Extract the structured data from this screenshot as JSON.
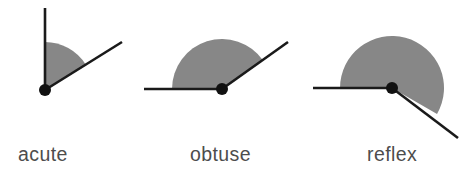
{
  "figure": {
    "background_color": "#ffffff",
    "width": 467,
    "height": 173,
    "sector_fill_color": "#878787",
    "ray_color": "#1a1a1a",
    "vertex_dot_color": "#111111",
    "label_color": "#4d4d4d"
  },
  "chart_data": {
    "type": "diagram",
    "subtitle": "",
    "diagram_kind": "angle-classification",
    "legend_position": "below-each-figure",
    "grid": false,
    "items": [
      {
        "label": "acute",
        "angle_degrees": 58,
        "classification": "acute",
        "vertex": {
          "x": 45,
          "y": 90
        },
        "sector_radius": 48,
        "dot_radius": 6,
        "shaded_from_degrees": 90,
        "shaded_to_degrees": 32,
        "rays": [
          {
            "name": "vertical-ray",
            "angle_degrees": 90,
            "length": 82,
            "end": {
              "x": 45,
              "y": 8
            }
          },
          {
            "name": "diagonal-ray",
            "angle_degrees": 32,
            "length": 91,
            "end": {
              "x": 122,
              "y": 42
            }
          }
        ]
      },
      {
        "label": "obtuse",
        "angle_degrees": 145,
        "classification": "obtuse",
        "vertex": {
          "x": 222,
          "y": 89
        },
        "sector_radius": 50,
        "dot_radius": 6,
        "shaded_from_degrees": 180,
        "shaded_to_degrees": 35,
        "rays": [
          {
            "name": "horizontal-ray",
            "angle_degrees": 180,
            "length": 78,
            "end": {
              "x": 144,
              "y": 89
            }
          },
          {
            "name": "diagonal-ray",
            "angle_degrees": 35,
            "length": 81,
            "end": {
              "x": 288,
              "y": 42
            }
          }
        ]
      },
      {
        "label": "reflex",
        "angle_degrees": 210,
        "classification": "reflex",
        "vertex": {
          "x": 392,
          "y": 88
        },
        "sector_radius": 52,
        "dot_radius": 6,
        "shaded_from_degrees": 180,
        "shaded_to_degrees": -30,
        "rays": [
          {
            "name": "horizontal-ray",
            "angle_degrees": 180,
            "length": 79,
            "end": {
              "x": 313,
              "y": 88
            }
          },
          {
            "name": "diagonal-ray",
            "angle_degrees": -30,
            "length": 76,
            "end": {
              "x": 458,
              "y": 138
            }
          }
        ]
      }
    ]
  },
  "labels": {
    "acute": "acute",
    "obtuse": "obtuse",
    "reflex": "reflex"
  },
  "label_positions": {
    "acute": {
      "x": 18,
      "y": 161
    },
    "obtuse": {
      "x": 190,
      "y": 161
    },
    "reflex": {
      "x": 367,
      "y": 161
    }
  }
}
